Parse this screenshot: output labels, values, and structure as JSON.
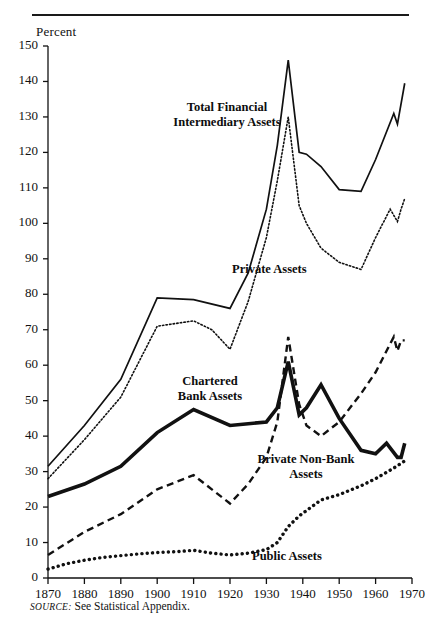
{
  "figure": {
    "y_axis_title": "Percent",
    "source_prefix": "SOURCE:",
    "source_text": "See Statistical Appendix."
  },
  "labels": {
    "total": "Total Financial\nIntermediary Assets",
    "total_line1": "Total Financial",
    "total_line2": "Intermediary Assets",
    "private": "Private Assets",
    "chartered_line1": "Chartered",
    "chartered_line2": "Bank Assets",
    "nonbank_line1": "Private Non-Bank",
    "nonbank_line2": "Assets",
    "public": "Public Assets"
  },
  "ticks": {
    "y": [
      "150",
      "140",
      "130",
      "120",
      "110",
      "100",
      "90",
      "80",
      "70",
      "60",
      "50",
      "40",
      "30",
      "20",
      "10",
      "0"
    ],
    "x": [
      "1870",
      "1880",
      "1890",
      "1900",
      "1910",
      "1920",
      "1930",
      "1940",
      "1950",
      "1960",
      "1970"
    ]
  },
  "colors": {
    "ink": "#111111",
    "rule": "#1a1a1a",
    "background": "#ffffff"
  },
  "chart_data": {
    "type": "line",
    "title": "",
    "subtitle": "",
    "xlabel": "",
    "ylabel": "Percent",
    "xlim": [
      1870,
      1970
    ],
    "ylim": [
      0,
      150
    ],
    "ytick_step": 10,
    "xtick_step": 10,
    "grid": false,
    "legend": "inline-annotations",
    "series": [
      {
        "name": "Total Financial Intermediary Assets",
        "style": "solid-thin",
        "x": [
          1870,
          1880,
          1890,
          1900,
          1910,
          1920,
          1925,
          1930,
          1933,
          1936,
          1939,
          1941,
          1945,
          1950,
          1956,
          1960,
          1965,
          1966,
          1968
        ],
        "values": [
          31.5,
          43.0,
          56.0,
          79.0,
          78.5,
          76.0,
          86.0,
          104.0,
          122.0,
          146.0,
          120.0,
          119.5,
          116.0,
          109.5,
          109.0,
          118.0,
          131.0,
          128.0,
          139.5
        ]
      },
      {
        "name": "Private Assets",
        "style": "dotted-fine",
        "x": [
          1870,
          1880,
          1890,
          1900,
          1910,
          1915,
          1920,
          1925,
          1930,
          1933,
          1936,
          1939,
          1941,
          1945,
          1950,
          1956,
          1960,
          1964,
          1966,
          1967,
          1968
        ],
        "values": [
          28.0,
          39.0,
          51.0,
          71.0,
          72.5,
          70.0,
          64.5,
          78.0,
          96.0,
          112.0,
          130.0,
          105.0,
          100.0,
          93.0,
          89.0,
          87.0,
          96.0,
          104.0,
          100.5,
          104.0,
          107.0
        ]
      },
      {
        "name": "Chartered Bank Assets",
        "style": "solid-thick",
        "x": [
          1870,
          1880,
          1890,
          1900,
          1910,
          1920,
          1925,
          1930,
          1933,
          1936,
          1939,
          1941,
          1945,
          1950,
          1956,
          1960,
          1963,
          1966,
          1967,
          1968
        ],
        "values": [
          23.0,
          26.5,
          31.5,
          41.0,
          47.5,
          43.0,
          43.5,
          44.0,
          48.0,
          61.0,
          46.0,
          48.0,
          54.5,
          45.0,
          36.0,
          35.0,
          38.0,
          34.0,
          34.0,
          38.0
        ]
      },
      {
        "name": "Private Non-Bank Assets",
        "style": "dashed",
        "x": [
          1870,
          1880,
          1890,
          1900,
          1910,
          1920,
          1925,
          1930,
          1933,
          1936,
          1939,
          1941,
          1945,
          1950,
          1956,
          1960,
          1965,
          1966,
          1967,
          1968
        ],
        "values": [
          6.5,
          13.0,
          18.0,
          25.0,
          29.0,
          21.0,
          26.5,
          34.0,
          44.0,
          68.0,
          49.0,
          43.0,
          40.0,
          44.0,
          52.0,
          58.0,
          68.0,
          64.0,
          67.0,
          67.0
        ]
      },
      {
        "name": "Public Assets",
        "style": "dotted-bold",
        "x": [
          1870,
          1875,
          1880,
          1885,
          1890,
          1895,
          1900,
          1905,
          1910,
          1915,
          1920,
          1925,
          1930,
          1933,
          1936,
          1939,
          1941,
          1945,
          1950,
          1956,
          1960,
          1965,
          1968
        ],
        "values": [
          2.5,
          4.0,
          5.0,
          5.8,
          6.3,
          6.8,
          7.2,
          7.4,
          7.8,
          7.0,
          6.5,
          7.0,
          8.0,
          10.0,
          14.5,
          17.5,
          19.0,
          22.0,
          23.5,
          26.0,
          28.0,
          31.0,
          33.0
        ]
      }
    ]
  }
}
